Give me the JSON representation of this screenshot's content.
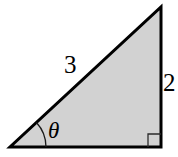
{
  "figure": {
    "name": "right-triangle-diagram",
    "background_color": "#ffffff",
    "fill_color": "#d2d2d2",
    "stroke_color": "#000000",
    "stroke_width": 3,
    "thin_stroke_width": 1.3,
    "vertices": {
      "left": {
        "x": 10,
        "y": 147
      },
      "bottom_right": {
        "x": 161,
        "y": 147
      },
      "apex": {
        "x": 161,
        "y": 7
      }
    },
    "labels": {
      "hypotenuse": "3",
      "vertical_leg": "2",
      "angle": "θ"
    },
    "angle_arc": {
      "name": "theta-angle-arc",
      "center": {
        "x": 10,
        "y": 147
      },
      "radius": 36,
      "start_angle_deg": 0,
      "end_angle_deg": 42.8
    },
    "right_angle_marker": {
      "name": "right-angle-marker",
      "corner": {
        "x": 161,
        "y": 147
      },
      "size": 13
    }
  }
}
